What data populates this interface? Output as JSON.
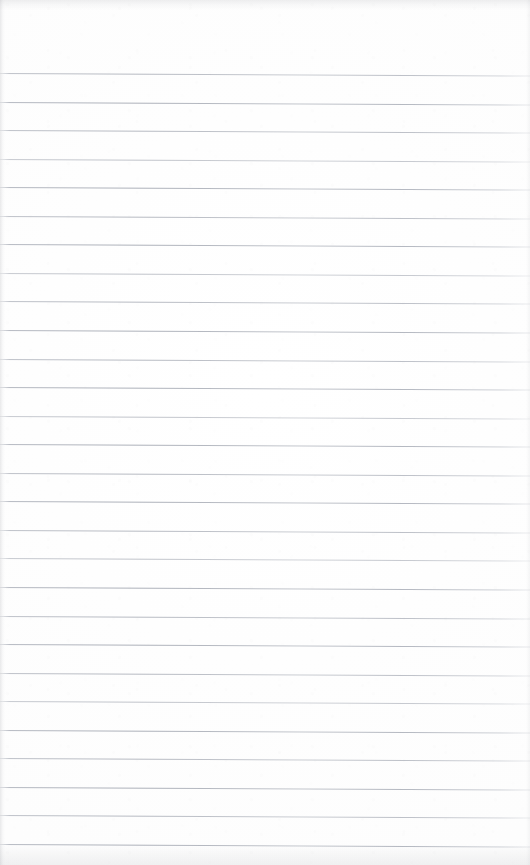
{
  "document": {
    "kind": "scanned-lined-paper",
    "title": "Blank ruled notebook page",
    "content_text": "",
    "written_content": "none",
    "page_width": 530,
    "page_height": 865
  },
  "paper": {
    "background_color": "#fdfdfd",
    "edge_shadow_color": "#96989e"
  },
  "ruling": {
    "line_color": "#b9bdc5",
    "line_count": 28,
    "first_line_y": 73,
    "last_line_y": 844,
    "line_spacing": 28.55,
    "line_thickness": 1,
    "slope_px_across_page": 2.5,
    "top_margin": 73,
    "left_margin": 0,
    "right_margin": 0,
    "margin_rule": "none",
    "line_y_positions": [
      73,
      101.6,
      130.1,
      158.7,
      187.2,
      215.8,
      244.3,
      272.9,
      301.4,
      330.0,
      358.5,
      387.1,
      415.6,
      444.2,
      472.7,
      501.3,
      529.8,
      558.4,
      586.9,
      615.5,
      644.0,
      672.6,
      701.1,
      729.7,
      758.2,
      786.8,
      815.3,
      843.9
    ],
    "ink_weights": [
      "mid",
      "dark",
      "mid",
      "light",
      "dark",
      "mid",
      "dark",
      "light",
      "mid",
      "dark",
      "mid",
      "dark",
      "light",
      "dark",
      "mid",
      "dark",
      "mid",
      "light",
      "dark",
      "mid",
      "dark",
      "mid",
      "light",
      "dark",
      "mid",
      "dark",
      "mid",
      "dark"
    ]
  }
}
